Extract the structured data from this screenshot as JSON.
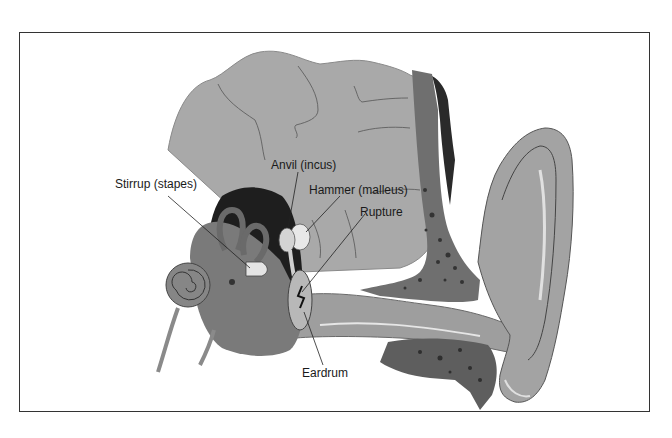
{
  "diagram": {
    "labels": {
      "stirrup": "Stirrup (stapes)",
      "anvil": "Anvil (incus)",
      "hammer": "Hammer (malleus)",
      "rupture": "Rupture",
      "eardrum": "Eardrum"
    },
    "colors": {
      "bone": "#a8a8a8",
      "dark_tissue": "#5e5e5e",
      "cavity": "#1e1e1e",
      "skin": "#9a9a9a",
      "hair": "#2a2a2a",
      "frame": "#333333"
    }
  }
}
